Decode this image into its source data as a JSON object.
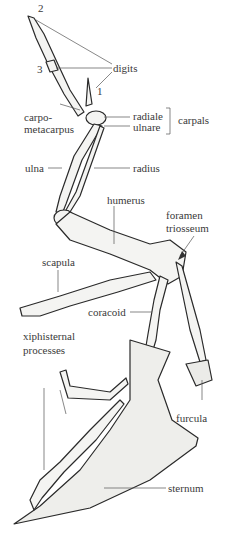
{
  "figure": {
    "labels": {
      "digit_2": "2",
      "digit_3": "3",
      "digit_1": "1",
      "digits": "digits",
      "carpometacarpus_line1": "carpo-",
      "carpometacarpus_line2": "metacarpus",
      "radiale": "radiale",
      "ulnare": "ulnare",
      "carpals": "carpals",
      "ulna": "ulna",
      "radius": "radius",
      "humerus": "humerus",
      "foramen_line1": "foramen",
      "foramen_line2": "triosseum",
      "scapula": "scapula",
      "coracoid": "coracoid",
      "xiphisternal_line1": "xiphisternal",
      "xiphisternal_line2": "processes",
      "furcula": "furcula",
      "sternum": "sternum"
    },
    "colors": {
      "bone_fill": "#f4f4f2",
      "bone_stroke": "#2a2a2a",
      "leader_line": "#555555",
      "text": "#3a3a3a"
    }
  }
}
